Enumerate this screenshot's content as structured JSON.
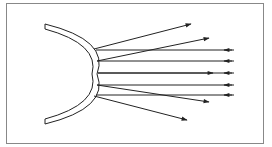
{
  "diagram": {
    "colors": {
      "stroke": "#222222",
      "frame": "#888888",
      "background": "#ffffff"
    },
    "frame": {
      "x": 6,
      "y": 3,
      "w": 258,
      "h": 141
    },
    "mirror": {
      "shape": "arc",
      "outer_top": [
        45,
        24
      ],
      "outer_apex": [
        97,
        74
      ],
      "outer_bottom": [
        45,
        124
      ],
      "thickness": 5
    },
    "incident_rays": [
      {
        "y": 50,
        "x_start": 234,
        "x_end": 96,
        "arrow_x": 226,
        "direction": "left"
      },
      {
        "y": 61,
        "x_start": 234,
        "x_end": 97,
        "arrow_x": 226,
        "direction": "left"
      },
      {
        "y": 73,
        "x_start": 234,
        "x_end": 98,
        "arrow_x": 226,
        "direction": "left"
      },
      {
        "y": 85,
        "x_start": 234,
        "x_end": 97,
        "arrow_x": 226,
        "direction": "left"
      },
      {
        "y": 95,
        "x_start": 234,
        "x_end": 96,
        "arrow_x": 226,
        "direction": "left"
      }
    ],
    "reflected_rays": [
      {
        "from": [
          94,
          49
        ],
        "to": [
          191,
          24
        ]
      },
      {
        "from": [
          97,
          61
        ],
        "to": [
          209,
          38
        ]
      },
      {
        "from": [
          98,
          73
        ],
        "to": [
          213,
          73
        ]
      },
      {
        "from": [
          97,
          85
        ],
        "to": [
          209,
          102
        ]
      },
      {
        "from": [
          94,
          96
        ],
        "to": [
          187,
          120
        ]
      }
    ]
  }
}
